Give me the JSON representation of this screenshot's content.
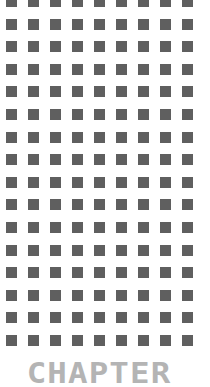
{
  "pattern": {
    "rows": 16,
    "cols": 9,
    "square_color": "#5f5f5f",
    "background": "#ffffff"
  },
  "title": {
    "text": "CHAPTER",
    "color": "#b4b4b4"
  }
}
